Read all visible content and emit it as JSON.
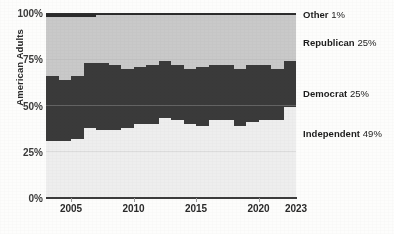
{
  "chart_data": {
    "type": "area",
    "title": "",
    "subtitle": "",
    "xlabel": "",
    "ylabel": "American Adults",
    "xlim": [
      2003.5,
      2023.5
    ],
    "ylim": [
      0,
      100
    ],
    "grid": true,
    "grid_axis": "y",
    "stacked": true,
    "step": true,
    "legend_position": "right-inline",
    "y_ticks": [
      "0%",
      "25%",
      "50%",
      "75%",
      "100%"
    ],
    "y_tick_values": [
      0,
      25,
      50,
      75,
      100
    ],
    "x_ticks": [
      "2005",
      "2010",
      "2015",
      "2020",
      "2023"
    ],
    "x_tick_values": [
      2005,
      2010,
      2015,
      2020,
      2023
    ],
    "x": [
      2004,
      2005,
      2006,
      2007,
      2008,
      2009,
      2010,
      2011,
      2012,
      2013,
      2014,
      2015,
      2016,
      2017,
      2018,
      2019,
      2020,
      2021,
      2022,
      2023
    ],
    "series": [
      {
        "name": "Independent",
        "label": "Independent",
        "value_label": "49%",
        "latest_value": 49,
        "color": "#eeeeee",
        "values": [
          31,
          31,
          32,
          38,
          37,
          37,
          38,
          40,
          40,
          43,
          42,
          40,
          39,
          42,
          42,
          39,
          41,
          42,
          42,
          49
        ]
      },
      {
        "name": "Democrat",
        "label": "Democrat",
        "value_label": "25%",
        "latest_value": 25,
        "color": "#3a3a3a",
        "values": [
          35,
          33,
          34,
          35,
          36,
          35,
          32,
          31,
          32,
          31,
          30,
          30,
          32,
          30,
          30,
          31,
          31,
          30,
          28,
          25
        ]
      },
      {
        "name": "Republican",
        "label": "Republican",
        "value_label": "25%",
        "latest_value": 25,
        "color": "#c9c9c9",
        "values": [
          32,
          34,
          32,
          25,
          26,
          27,
          29,
          28,
          27,
          25,
          27,
          29,
          28,
          27,
          27,
          29,
          27,
          27,
          29,
          25
        ]
      },
      {
        "name": "Other",
        "label": "Other",
        "value_label": "1%",
        "latest_value": 1,
        "color": "#2b2b2b",
        "values": [
          2,
          2,
          2,
          2,
          1,
          1,
          1,
          1,
          1,
          1,
          1,
          1,
          1,
          1,
          1,
          1,
          1,
          1,
          1,
          1
        ]
      }
    ]
  },
  "colors": {
    "background": "#fdfdfc",
    "axis": "#3c3c3c",
    "grid": "#b8b8b8",
    "text": "#1c1c1c"
  }
}
